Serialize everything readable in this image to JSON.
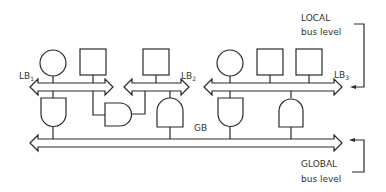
{
  "diagram": {
    "type": "bus hierarchy",
    "local_label": {
      "line1": "LOCAL",
      "line2": "bus level"
    },
    "global_label": {
      "line1": "GLOBAL",
      "line2": "bus level"
    },
    "local_buses": [
      {
        "name": "LB",
        "sub": "1"
      },
      {
        "name": "LB",
        "sub": "2"
      },
      {
        "name": "LB",
        "sub": "3"
      }
    ],
    "global_bus": {
      "name": "GB"
    },
    "nodes": {
      "lb1": [
        "circle",
        "square"
      ],
      "lb2": [
        "square"
      ],
      "lb3": [
        "circle",
        "square",
        "square"
      ]
    },
    "gates": [
      "lb1-to-gb gate",
      "lb1-lb2 bridge gate",
      "lb2-to-gb gate",
      "lb3-to-gb gate",
      "lb3-to-gb gate"
    ]
  }
}
